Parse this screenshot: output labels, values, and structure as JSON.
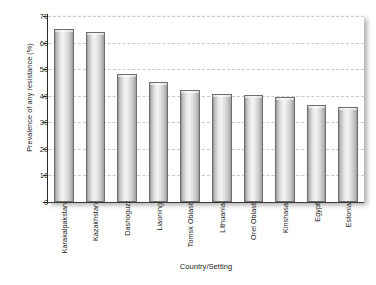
{
  "chart_data": {
    "type": "bar",
    "title": "",
    "subtitle": "",
    "xlabel": "Country/Setting",
    "ylabel": "Prevalence of any resistance (%)",
    "categories": [
      "Karakalpakstan",
      "Kazakhstan",
      "Dashoguz",
      "Liaoning",
      "Tomsk Oblast",
      "Lithuania",
      "Orel Oblast",
      "Kinshasa",
      "Egypt",
      "Estonia"
    ],
    "values": [
      65.0,
      64.0,
      48.3,
      45.2,
      42.0,
      40.6,
      40.3,
      39.4,
      36.5,
      35.6
    ],
    "ylim": [
      0,
      70
    ],
    "yticks": [
      0,
      10,
      20,
      30,
      40,
      50,
      60,
      70
    ],
    "ytick_labels": [
      "0",
      "10",
      "20",
      "30",
      "40",
      "50",
      "60",
      "70"
    ],
    "grid": true,
    "grid_style": "dashed-horizontal",
    "legend": false,
    "legend_position": "none",
    "bar_fill": "#e8e8e8",
    "bar_edge": "#6e6e6e",
    "grid_color": "#c9c9c9",
    "axis_color": "#2c2c2c",
    "text_color": "#1d1d1d",
    "background": "#ffffff"
  }
}
